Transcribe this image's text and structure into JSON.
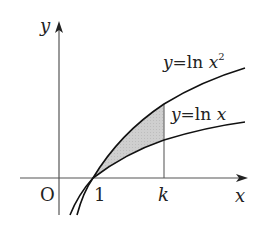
{
  "figure": {
    "axes": {
      "x_label": "x",
      "y_label": "y",
      "origin_label": "O"
    },
    "ticks": {
      "one": "1",
      "k": "k"
    },
    "curves": [
      {
        "name": "ln-x-squared",
        "eq_lhs": "y",
        "eq_sign": "=",
        "eq_fn": "ln",
        "eq_var": "x",
        "eq_exp": "2"
      },
      {
        "name": "ln-x",
        "eq_lhs": "y",
        "eq_sign": "=",
        "eq_fn": "ln",
        "eq_var": "x"
      }
    ],
    "shaded_region": {
      "description": "region between y=ln x^2 and y=ln x from x=1 to x=k",
      "fill": "#c8c8c8"
    },
    "colors": {
      "curve": "#111111",
      "axis": "#555555",
      "shade": "#c8c8c8"
    }
  }
}
